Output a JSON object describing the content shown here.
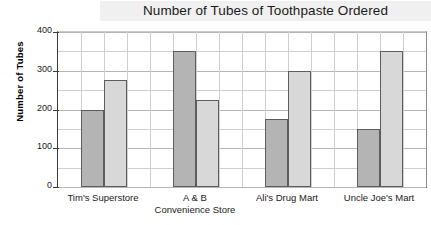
{
  "chart_data": {
    "type": "bar",
    "title": "Number of Tubes of Toothpaste Ordered",
    "xlabel": "",
    "ylabel": "Number of Tubes",
    "ylim": [
      0,
      400
    ],
    "ytick_labels": [
      "400",
      "300",
      "200",
      "100",
      "0"
    ],
    "ytick_values": [
      400,
      300,
      200,
      100,
      0
    ],
    "minor_gridline_step": 50,
    "grid": true,
    "legend": "none",
    "categories": [
      "Tim's Superstore",
      "A & B\nConvenience Store",
      "Ali's Drug Mart",
      "Uncle Joe's Mart"
    ],
    "series": [
      {
        "name": "dark",
        "color": "#b4b4b4",
        "values": [
          200,
          350,
          175,
          150
        ]
      },
      {
        "name": "light",
        "color": "#d8d8d8",
        "values": [
          275,
          225,
          300,
          350
        ]
      }
    ],
    "bars": [
      {
        "category": "Tim's Superstore",
        "series": "dark",
        "value": 200
      },
      {
        "category": "Tim's Superstore",
        "series": "light",
        "value": 275
      },
      {
        "category": "A & B Convenience Store",
        "series": "dark",
        "value": 350
      },
      {
        "category": "A & B Convenience Store",
        "series": "light",
        "value": 225
      },
      {
        "category": "Ali's Drug Mart",
        "series": "dark",
        "value": 175
      },
      {
        "category": "Ali's Drug Mart",
        "series": "light",
        "value": 300
      },
      {
        "category": "Uncle Joe's Mart",
        "series": "dark",
        "value": 150
      },
      {
        "category": "Uncle Joe's Mart",
        "series": "light",
        "value": 350
      }
    ]
  },
  "colors": {
    "bar_dark": "#b4b4b4",
    "bar_light": "#d8d8d8",
    "bar_border": "#5d5d5d",
    "axis": "#3a3a3a",
    "grid": "#cfcfcf",
    "title_band": "#f0f0f0",
    "text": "#1a1a1a",
    "background": "#ffffff"
  }
}
